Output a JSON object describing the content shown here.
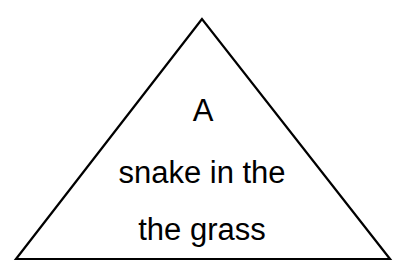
{
  "diagram": {
    "shape": "triangle",
    "stroke_color": "#000000",
    "fill_color": "#ffffff",
    "lines": [
      "A",
      "snake in the",
      "the grass"
    ]
  }
}
